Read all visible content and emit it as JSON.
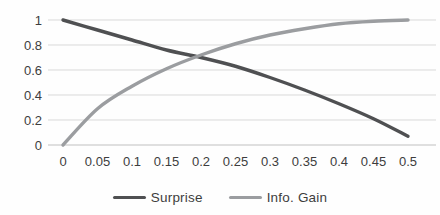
{
  "chart_data": {
    "type": "line",
    "title": "",
    "xlabel": "",
    "ylabel": "",
    "xlim": [
      0,
      0.5
    ],
    "ylim": [
      0,
      1
    ],
    "grid": "horizontal-only",
    "legend_position": "bottom-center",
    "categories": [
      0,
      0.05,
      0.1,
      0.15,
      0.2,
      0.25,
      0.3,
      0.35,
      0.4,
      0.45,
      0.5
    ],
    "x_tick_labels": [
      "0",
      "0.05",
      "0.1",
      "0.15",
      "0.2",
      "0.25",
      "0.3",
      "0.35",
      "0.4",
      "0.45",
      "0.5"
    ],
    "y_ticks": [
      0,
      0.2,
      0.4,
      0.6,
      0.8,
      1
    ],
    "y_tick_labels": [
      "0",
      "0.2",
      "0.4",
      "0.6",
      "0.8",
      "1"
    ],
    "series": [
      {
        "name": "Surprise",
        "color": "#4f5052",
        "values": [
          1.0,
          0.92,
          0.84,
          0.76,
          0.7,
          0.63,
          0.54,
          0.44,
          0.33,
          0.21,
          0.07
        ]
      },
      {
        "name": "Info. Gain",
        "color": "#9b9da0",
        "values": [
          0,
          0.29,
          0.47,
          0.61,
          0.72,
          0.81,
          0.88,
          0.93,
          0.97,
          0.99,
          1.0
        ]
      }
    ]
  },
  "style": {
    "gridline_color": "#d9d9d9",
    "axis_line_color": "#c0c0c0",
    "tick_label_color": "#3d3d3d",
    "background": "#fefefe"
  }
}
